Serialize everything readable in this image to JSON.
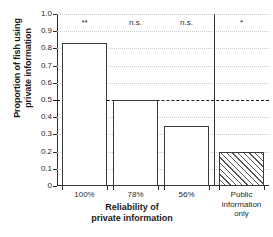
{
  "chart_data": {
    "type": "bar",
    "title": "",
    "xlabel": "Reliability of private information",
    "xlabel_lines": [
      "Reliability of",
      "private information"
    ],
    "ylabel": "Proportion of fish using private information",
    "ylabel_lines": [
      "Proportion of fish using",
      "private information"
    ],
    "categories": [
      "100%",
      "78%",
      "56%",
      "Public information only"
    ],
    "category_label_lines": [
      [
        "100%"
      ],
      [
        "78%"
      ],
      [
        "56%"
      ],
      [
        "Public",
        "information",
        "only"
      ]
    ],
    "values": [
      0.83,
      0.5,
      0.35,
      0.2
    ],
    "bar_styles": [
      "open",
      "open",
      "open",
      "hatched"
    ],
    "annotations": [
      "**",
      "n.s.",
      "n.s.",
      "*"
    ],
    "ylim": [
      0,
      1.0
    ],
    "ytick_values": [
      1.0,
      0.9,
      0.8,
      0.7,
      0.6,
      0.5,
      0.4,
      0.3,
      0.2,
      0.1,
      0
    ],
    "ytick_labels": [
      "1.0",
      "0.9",
      "0.8",
      "0.7",
      "0.6",
      "0.5",
      "0.4",
      "0.3",
      "0.2",
      "0.1",
      "0"
    ],
    "reference_line": 0.5,
    "grid": "horizontal-dotted",
    "legend": "none",
    "group_separator_after_index": 2,
    "colors": {
      "axis": "#2b2b2b",
      "bar_edge": "#3a3a3a",
      "bar_fill": "#ffffff",
      "hatch": "#555555",
      "gridline": "#c9c9c9",
      "reference_line": "#1a1a1a",
      "text": "#1a1a1a",
      "background": "#ffffff"
    }
  }
}
